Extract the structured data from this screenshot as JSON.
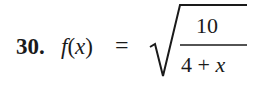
{
  "problem": {
    "number": "30.",
    "function_name": "f",
    "open_paren": "(",
    "variable": "x",
    "close_paren": ")",
    "equals": "=",
    "radicand": {
      "numerator": "10",
      "denominator_constant": "4",
      "denominator_operator": "+",
      "denominator_variable": "x"
    }
  },
  "colors": {
    "text": "#1a1a1a",
    "background": "#ffffff"
  }
}
